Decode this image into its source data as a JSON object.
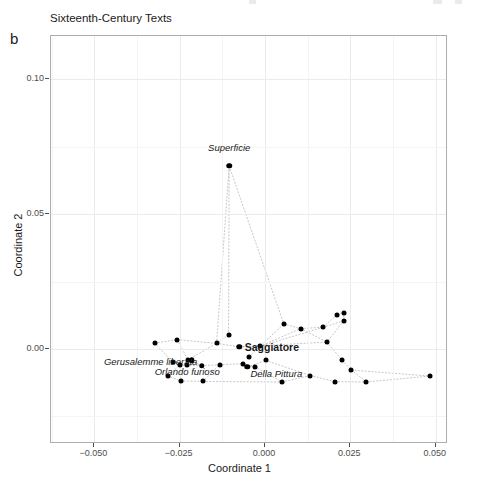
{
  "figure": {
    "panel_letter": "b",
    "title": "Sixteenth-Century Texts",
    "background": "#ffffff",
    "point_color": "#000000",
    "edge_color": "#bfbfbf",
    "grid_major_color": "#ebebeb",
    "panel_border_color": "#adadad"
  },
  "chart_data": {
    "type": "scatter",
    "title": "Sixteenth-Century Texts",
    "xlabel": "Coordinate 1",
    "ylabel": "Coordinate 2",
    "xlim": [
      -0.0627,
      0.0536
    ],
    "ylim": [
      -0.0352,
      0.1161
    ],
    "xticks": [
      -0.05,
      -0.025,
      0.0,
      0.025,
      0.05
    ],
    "xticklabels": [
      "−0.050",
      "−0.025",
      "0.000",
      "0.025",
      "0.050"
    ],
    "yticks": [
      0.0,
      0.05,
      0.1
    ],
    "yticklabels": [
      "0.00",
      "0.05",
      "0.10"
    ],
    "grid": true,
    "legend": null,
    "points": [
      {
        "x": -0.0105,
        "y": 0.0679,
        "label": "Superficie",
        "label_style": "italic",
        "label_dx": 0.0,
        "label_dy": 0.0072
      },
      {
        "x": -0.0323,
        "y": 0.0022,
        "label": null
      },
      {
        "x": -0.0257,
        "y": 0.0035,
        "label": null
      },
      {
        "x": -0.0226,
        "y": -0.004,
        "label": null
      },
      {
        "x": -0.0271,
        "y": -0.0049,
        "label": null
      },
      {
        "x": -0.0249,
        "y": -0.0058,
        "label": null
      },
      {
        "x": -0.023,
        "y": -0.006,
        "label": null
      },
      {
        "x": -0.0285,
        "y": -0.01,
        "label": null
      },
      {
        "x": -0.0247,
        "y": -0.0118,
        "label": null
      },
      {
        "x": -0.0182,
        "y": -0.012,
        "label": null
      },
      {
        "x": -0.0142,
        "y": 0.0021,
        "label": null
      },
      {
        "x": -0.0133,
        "y": -0.0058,
        "label": null
      },
      {
        "x": -0.0107,
        "y": 0.0053,
        "label": null
      },
      {
        "x": -0.0065,
        "y": -0.0054,
        "label": null
      },
      {
        "x": -0.0047,
        "y": -0.0029,
        "label": null
      },
      {
        "x": -0.003,
        "y": -0.0065,
        "label": null
      },
      {
        "x": -0.0015,
        "y": 0.001,
        "label": null
      },
      {
        "x": 0.0002,
        "y": -0.0042,
        "label": null
      },
      {
        "x": 0.0055,
        "y": 0.0093,
        "label": null
      },
      {
        "x": 0.005,
        "y": -0.0122,
        "label": null
      },
      {
        "x": 0.0104,
        "y": 0.0076,
        "label": null
      },
      {
        "x": 0.0133,
        "y": -0.0098,
        "label": null
      },
      {
        "x": 0.017,
        "y": 0.0081,
        "label": null
      },
      {
        "x": 0.0181,
        "y": 0.0026,
        "label": null
      },
      {
        "x": 0.0212,
        "y": 0.0128,
        "label": null
      },
      {
        "x": 0.023,
        "y": 0.0135,
        "label": null
      },
      {
        "x": 0.0231,
        "y": 0.0105,
        "label": null
      },
      {
        "x": 0.0226,
        "y": -0.0042,
        "label": null
      },
      {
        "x": 0.0205,
        "y": -0.0121,
        "label": null
      },
      {
        "x": 0.0253,
        "y": -0.0078,
        "label": null
      },
      {
        "x": 0.0297,
        "y": -0.0122,
        "label": null
      },
      {
        "x": 0.0483,
        "y": -0.01,
        "label": null
      },
      {
        "x": -0.0075,
        "y": 0.0008,
        "label": "Saggiatore",
        "label_style": "bold",
        "label_dx": 0.0095,
        "label_dy": 0.0
      },
      {
        "x": -0.0052,
        "y": -0.0066,
        "label": "Della Pittura",
        "label_style": "italic",
        "label_dx": 0.0085,
        "label_dy": -0.0023
      },
      {
        "x": -0.0215,
        "y": -0.0042,
        "label": "Gerusalemme liberata",
        "label_style": "italic",
        "label_dx": -0.012,
        "label_dy": -0.0004
      },
      {
        "x": -0.0186,
        "y": -0.0062,
        "label": "Orlando furioso",
        "label_style": "italic",
        "label_dx": -0.0042,
        "label_dy": -0.0021
      }
    ],
    "edges": [
      [
        -0.0323,
        0.0022,
        -0.0257,
        0.0035
      ],
      [
        -0.0323,
        0.0022,
        -0.0271,
        -0.0049
      ],
      [
        -0.0257,
        0.0035,
        -0.0142,
        0.0021
      ],
      [
        -0.0257,
        0.0035,
        -0.0226,
        -0.004
      ],
      [
        -0.0226,
        -0.004,
        -0.0215,
        -0.0042
      ],
      [
        -0.0215,
        -0.0042,
        -0.0186,
        -0.0062
      ],
      [
        -0.0271,
        -0.0049,
        -0.0249,
        -0.0058
      ],
      [
        -0.0249,
        -0.0058,
        -0.023,
        -0.006
      ],
      [
        -0.023,
        -0.006,
        -0.0186,
        -0.0062
      ],
      [
        -0.0285,
        -0.01,
        -0.0247,
        -0.0118
      ],
      [
        -0.0247,
        -0.0118,
        -0.0182,
        -0.012
      ],
      [
        -0.0285,
        -0.01,
        -0.0249,
        -0.0058
      ],
      [
        -0.0182,
        -0.012,
        -0.0133,
        -0.0058
      ],
      [
        -0.0142,
        0.0021,
        -0.0107,
        0.0053
      ],
      [
        -0.0142,
        0.0021,
        -0.0075,
        0.0008
      ],
      [
        -0.0107,
        0.0053,
        -0.0105,
        0.0679
      ],
      [
        -0.0105,
        0.0679,
        0.0055,
        0.0093
      ],
      [
        -0.0133,
        -0.0058,
        -0.0065,
        -0.0054
      ],
      [
        -0.0065,
        -0.0054,
        -0.0052,
        -0.0066
      ],
      [
        -0.0052,
        -0.0066,
        -0.003,
        -0.0065
      ],
      [
        -0.0047,
        -0.0029,
        -0.0015,
        0.001
      ],
      [
        -0.0075,
        0.0008,
        -0.0015,
        0.001
      ],
      [
        -0.0015,
        0.001,
        0.0055,
        0.0093
      ],
      [
        -0.0015,
        0.001,
        0.0104,
        0.0076
      ],
      [
        0.0002,
        -0.0042,
        0.0133,
        -0.0098
      ],
      [
        0.0055,
        0.0093,
        0.0104,
        0.0076
      ],
      [
        0.0104,
        0.0076,
        0.017,
        0.0081
      ],
      [
        0.017,
        0.0081,
        0.0212,
        0.0128
      ],
      [
        0.0212,
        0.0128,
        0.023,
        0.0135
      ],
      [
        0.023,
        0.0135,
        0.0231,
        0.0105
      ],
      [
        0.0231,
        0.0105,
        0.0181,
        0.0026
      ],
      [
        0.0181,
        0.0026,
        0.0226,
        -0.0042
      ],
      [
        0.0226,
        -0.0042,
        0.0253,
        -0.0078
      ],
      [
        0.0253,
        -0.0078,
        0.0297,
        -0.0122
      ],
      [
        0.0297,
        -0.0122,
        0.0483,
        -0.01
      ],
      [
        0.0253,
        -0.0078,
        0.0483,
        -0.01
      ],
      [
        0.0133,
        -0.0098,
        0.0205,
        -0.0121
      ],
      [
        0.0205,
        -0.0121,
        0.0297,
        -0.0122
      ],
      [
        -0.003,
        -0.0065,
        0.005,
        -0.0122
      ],
      [
        0.005,
        -0.0122,
        0.0133,
        -0.0098
      ],
      [
        -0.0182,
        -0.012,
        0.005,
        -0.0122
      ],
      [
        -0.0075,
        0.0008,
        0.0181,
        0.0026
      ],
      [
        0.017,
        0.0081,
        0.0231,
        0.0105
      ],
      [
        -0.0226,
        -0.004,
        -0.0142,
        0.0021
      ],
      [
        -0.0052,
        -0.0066,
        0.0002,
        -0.0042
      ],
      [
        -0.0186,
        -0.0062,
        -0.0133,
        -0.0058
      ],
      [
        0.0104,
        0.0076,
        0.0181,
        0.0026
      ],
      [
        -0.0015,
        0.001,
        0.017,
        0.0081
      ],
      [
        -0.0105,
        0.0679,
        -0.0142,
        0.0021
      ]
    ]
  },
  "axes": {
    "x_title": "Coordinate 1",
    "y_title": "Coordinate 2"
  }
}
